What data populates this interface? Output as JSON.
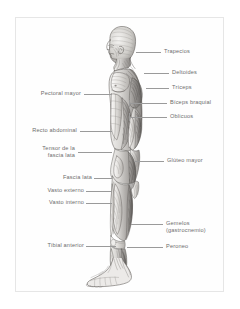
{
  "plate": {
    "title": "Musculatura del cuerpo humano (vista lateral)",
    "figure_name": "male-anatomical-figure-lateral-view",
    "frame_color": "#e6e6e6",
    "label_color": "#6d6d6d",
    "leader_color": "#9a9a9a",
    "background": "#ffffff"
  },
  "labels_right": [
    {
      "id": "trapecios",
      "text": "Trapecios",
      "text2": ""
    },
    {
      "id": "deltoides",
      "text": "Deltoides",
      "text2": ""
    },
    {
      "id": "triceps",
      "text": "Tríceps",
      "text2": ""
    },
    {
      "id": "biceps",
      "text": "Bíceps braquial",
      "text2": ""
    },
    {
      "id": "oblicuos",
      "text": "Oblicuos",
      "text2": ""
    },
    {
      "id": "gluteo",
      "text": "Glúteo mayor",
      "text2": ""
    },
    {
      "id": "gemelos",
      "text": "Gemelos",
      "text2": "(gastrocnemio)"
    },
    {
      "id": "peroneo",
      "text": "Peroneo",
      "text2": ""
    }
  ],
  "labels_left": [
    {
      "id": "pectoral",
      "text": "Pectoral mayor",
      "text2": ""
    },
    {
      "id": "recto",
      "text": "Recto abdominal",
      "text2": ""
    },
    {
      "id": "tensor",
      "text": "Tensor de la",
      "text2": "fascia lata"
    },
    {
      "id": "fascialata",
      "text": "Fascia lata",
      "text2": ""
    },
    {
      "id": "vastoext",
      "text": "Vasto externo",
      "text2": ""
    },
    {
      "id": "vastoint",
      "text": "Vasto interno",
      "text2": ""
    },
    {
      "id": "tibial",
      "text": "Tibial anterior",
      "text2": ""
    }
  ]
}
